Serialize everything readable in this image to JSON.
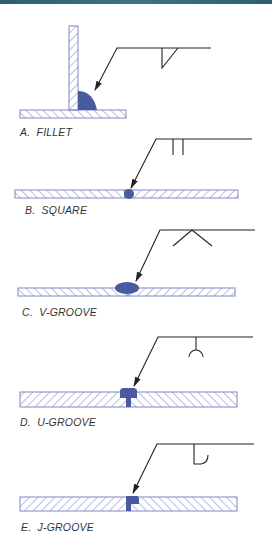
{
  "figure": {
    "colors": {
      "weld": "#4a5a9e",
      "hatch": "#7f88c8",
      "line": "#222222",
      "header_bar": "#356a7c"
    },
    "panels": [
      {
        "id": "A",
        "label": "A.  FILLET",
        "symbol": "fillet-triangle"
      },
      {
        "id": "B",
        "label": "B.  SQUARE",
        "symbol": "square-double-bar"
      },
      {
        "id": "C",
        "label": "C.  V-GROOVE",
        "symbol": "v-groove"
      },
      {
        "id": "D",
        "label": "D.  U-GROOVE",
        "symbol": "u-groove"
      },
      {
        "id": "E",
        "label": "E.  J-GROOVE",
        "symbol": "j-groove"
      }
    ]
  }
}
